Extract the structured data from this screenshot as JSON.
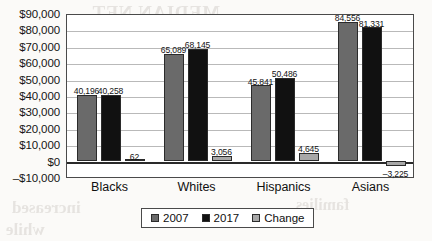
{
  "chart_data": {
    "type": "bar",
    "title": "",
    "xlabel": "",
    "ylabel": "",
    "categories": [
      "Blacks",
      "Whites",
      "Hispanics",
      "Asians"
    ],
    "series": [
      {
        "name": "2007",
        "color": "#6a6a6a",
        "values": [
          40196,
          65089,
          45841,
          84556
        ],
        "labels": [
          "40,196",
          "65,089",
          "45,841",
          "84,556"
        ]
      },
      {
        "name": "2017",
        "color": "#111111",
        "values": [
          40258,
          68145,
          50486,
          81331
        ],
        "labels": [
          "40,258",
          "68,145",
          "50,486",
          "81,331"
        ]
      },
      {
        "name": "Change",
        "color": "#a8a8a8",
        "values": [
          62,
          3056,
          4645,
          -3225
        ],
        "labels": [
          "62",
          "3,056",
          "4,645",
          "–3,225"
        ]
      }
    ],
    "ylim": [
      -10000,
      90000
    ],
    "ytick_values": [
      90000,
      80000,
      70000,
      60000,
      50000,
      40000,
      30000,
      20000,
      10000,
      0,
      -10000
    ],
    "ytick_labels": [
      "$90,000",
      "$80,000",
      "$70,000",
      "$60,000",
      "$50,000",
      "$40,000",
      "$30,000",
      "$20,000",
      "$10,000",
      "$0",
      "–$10,000"
    ],
    "grid": true,
    "legend_position": "bottom-center"
  },
  "legend": {
    "items": [
      {
        "label": "2007",
        "color": "#6a6a6a"
      },
      {
        "label": "2017",
        "color": "#111111"
      },
      {
        "label": "Change",
        "color": "#a8a8a8"
      }
    ]
  },
  "bleed_through_text": {
    "line1": "MEDIAN NET",
    "line2": "WORTH",
    "line3": "households",
    "line4": "of color",
    "line5": "the gap",
    "line6": "between",
    "line7": "increased",
    "line8": "while",
    "line9": "families"
  }
}
